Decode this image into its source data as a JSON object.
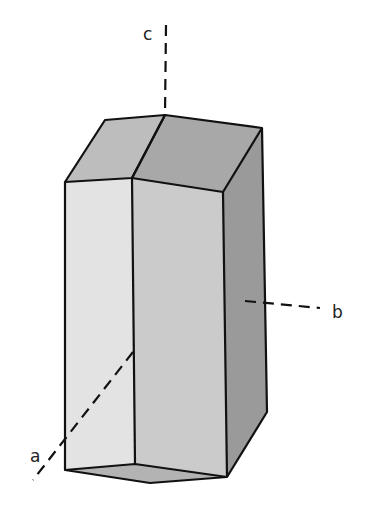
{
  "figure": {
    "axes": [
      {
        "id": "a",
        "label": "a"
      },
      {
        "id": "b",
        "label": "b"
      },
      {
        "id": "c",
        "label": "c"
      }
    ],
    "colors": {
      "face_top_left": "#bdbdbd",
      "face_top_right": "#a8a8a8",
      "face_front_left": "#e3e3e3",
      "face_front_mid": "#cbcbcb",
      "face_right": "#9a9a9a",
      "face_bottom": "#b3b3b3",
      "edge": "#111111"
    }
  }
}
